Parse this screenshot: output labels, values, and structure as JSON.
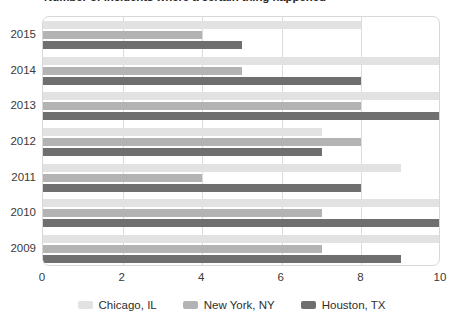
{
  "chart_data": {
    "type": "bar",
    "orientation": "horizontal",
    "title": "Number of incidents where a certain thing happened",
    "xlabel": "",
    "ylabel": "",
    "xlim": [
      0,
      10
    ],
    "xticks": [
      0,
      2,
      4,
      6,
      8,
      10
    ],
    "xtick_labels": [
      "0",
      "2",
      "4",
      "6",
      "8",
      "10"
    ],
    "grid": true,
    "grid_axis": "x",
    "legend_position": "bottom",
    "categories": [
      "2015",
      "2014",
      "2013",
      "2012",
      "2011",
      "2010",
      "2009"
    ],
    "series": [
      {
        "name": "Chicago, IL",
        "color": "#e2e2e2",
        "values": [
          8,
          10,
          10,
          7,
          9,
          10,
          10
        ]
      },
      {
        "name": "New York, NY",
        "color": "#b3b3b3",
        "values": [
          4,
          5,
          8,
          8,
          4,
          7,
          7
        ]
      },
      {
        "name": "Houston, TX",
        "color": "#6f6f6f",
        "values": [
          5,
          8,
          10,
          7,
          8,
          10,
          9
        ]
      }
    ]
  },
  "legend": {
    "items": [
      {
        "label": "Chicago, IL",
        "color": "#e2e2e2"
      },
      {
        "label": "New York, NY",
        "color": "#b3b3b3"
      },
      {
        "label": "Houston, TX",
        "color": "#6f6f6f"
      }
    ]
  },
  "axis": {
    "x_tick_labels": [
      "0",
      "2",
      "4",
      "6",
      "8",
      "10"
    ],
    "y_tick_labels": [
      "2015",
      "2014",
      "2013",
      "2012",
      "2011",
      "2010",
      "2009"
    ]
  }
}
